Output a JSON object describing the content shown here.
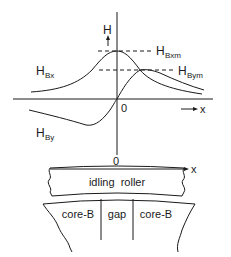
{
  "figure": {
    "axis": {
      "y_label": "H",
      "x_label": "x",
      "origin_label": "0"
    },
    "curves": [
      {
        "name": "H_Bx",
        "label_main": "H",
        "label_sub": "Bx"
      },
      {
        "name": "H_By",
        "label_main": "H",
        "label_sub": "By"
      }
    ],
    "markers": [
      {
        "name": "H_Bxm",
        "label_main": "H",
        "label_sub": "Bxm"
      },
      {
        "name": "H_Bym",
        "label_main": "H",
        "label_sub": "Bym"
      }
    ],
    "head": {
      "origin_label": "0",
      "x_label": "x",
      "roller_label": "idling  roller",
      "sections": [
        "core-B",
        "gap",
        "core-B"
      ]
    },
    "colors": {
      "ink": "#1a1a1a",
      "background": "#ffffff"
    }
  }
}
